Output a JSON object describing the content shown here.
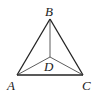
{
  "diagram": {
    "type": "geometry",
    "points": {
      "A": {
        "label": "A",
        "x": 17,
        "y": 75
      },
      "B": {
        "label": "B",
        "x": 50,
        "y": 19
      },
      "C": {
        "label": "C",
        "x": 83,
        "y": 75
      },
      "D": {
        "label": "D",
        "x": 50,
        "y": 57
      }
    },
    "segments": [
      {
        "from": "A",
        "to": "B",
        "weight": "thick"
      },
      {
        "from": "B",
        "to": "C",
        "weight": "thick"
      },
      {
        "from": "A",
        "to": "C",
        "weight": "thick"
      },
      {
        "from": "B",
        "to": "D",
        "weight": "thin"
      },
      {
        "from": "A",
        "to": "D",
        "weight": "thin"
      },
      {
        "from": "C",
        "to": "D",
        "weight": "thin"
      }
    ],
    "colors": {
      "line": "#222222",
      "background": "#ffffff"
    }
  }
}
